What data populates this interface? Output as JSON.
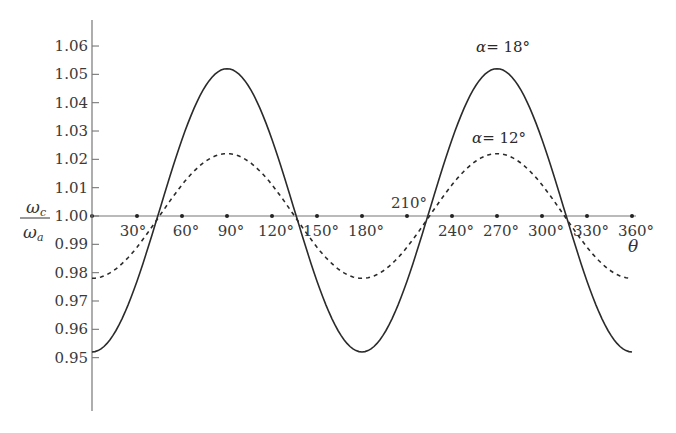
{
  "chart_data": {
    "type": "line",
    "title": "",
    "xlabel": "θ",
    "ylabel_numerator": "ω_c",
    "ylabel_denominator": "ω_a",
    "ylabel": "ω_c / ω_a",
    "xlim": [
      0,
      360
    ],
    "ylim": [
      0.94,
      1.065
    ],
    "grid": false,
    "legend": "inline labels on curves",
    "x_ticks": [
      30,
      60,
      90,
      120,
      150,
      180,
      210,
      240,
      270,
      300,
      330,
      360
    ],
    "x_tick_labels": [
      "30°",
      "60°",
      "90°",
      "120°",
      "150°",
      "180°",
      "210°",
      "240°",
      "270°",
      "300°",
      "330°",
      "360°"
    ],
    "y_ticks": [
      0.95,
      0.96,
      0.97,
      0.98,
      0.99,
      1.0,
      1.01,
      1.02,
      1.03,
      1.04,
      1.05,
      1.06
    ],
    "y_tick_labels": [
      "0.95",
      "0.96",
      "0.97",
      "0.98",
      "0.99",
      "1.00",
      "1.01",
      "1.02",
      "1.03",
      "1.04",
      "1.05",
      "1.06"
    ],
    "x": [
      0,
      15,
      30,
      45,
      60,
      75,
      90,
      105,
      120,
      135,
      150,
      165,
      180,
      195,
      210,
      225,
      240,
      255,
      270,
      285,
      300,
      315,
      330,
      345,
      360
    ],
    "series": [
      {
        "name": "α = 18°",
        "style": "solid",
        "values": [
          0.952,
          0.957,
          0.976,
          1.002,
          1.028,
          1.046,
          1.052,
          1.046,
          1.028,
          1.002,
          0.976,
          0.958,
          0.952,
          0.957,
          0.976,
          1.002,
          1.028,
          1.046,
          1.052,
          1.046,
          1.028,
          1.002,
          0.976,
          0.958,
          0.952
        ]
      },
      {
        "name": "α = 12°",
        "style": "dashed",
        "values": [
          0.978,
          0.981,
          0.989,
          1.0,
          1.011,
          1.019,
          1.022,
          1.019,
          1.011,
          1.0,
          0.989,
          0.981,
          0.978,
          0.981,
          0.989,
          1.0,
          1.011,
          1.019,
          1.022,
          1.019,
          1.011,
          1.0,
          0.989,
          0.981,
          0.978
        ]
      }
    ],
    "annotations": [
      {
        "text": "α = 18°",
        "near": [
          270,
          1.052
        ]
      },
      {
        "text": "α = 12°",
        "near": [
          270,
          1.022
        ]
      }
    ]
  },
  "labels": {
    "x_axis_var": "θ",
    "y_num": "ω",
    "y_num_sub": "c",
    "y_den": "ω",
    "y_den_sub": "a",
    "curve_18_alpha": "α",
    "curve_18_rest": "= 18°",
    "curve_12_alpha": "α",
    "curve_12_rest": "= 12°"
  }
}
